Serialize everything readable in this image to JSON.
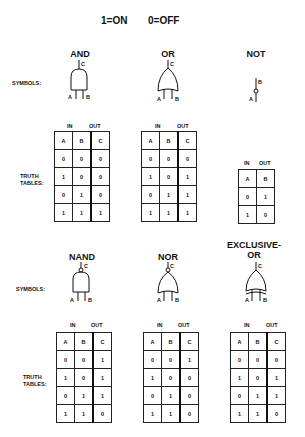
{
  "legend": {
    "on": "1=ON",
    "off": "0=OFF"
  },
  "row_labels": {
    "symbols": "SYMBOLS:",
    "truth_tables_1": "TRUTH",
    "truth_tables_2": "TABLES:"
  },
  "headers": {
    "in": "IN",
    "out": "OUT"
  },
  "gates": [
    {
      "name": "AND",
      "inputs": [
        "A",
        "B"
      ],
      "output": "C",
      "table": {
        "cols": [
          "A",
          "B",
          "C"
        ],
        "rows": [
          [
            "0",
            "0",
            "0"
          ],
          [
            "1",
            "0",
            "0"
          ],
          [
            "0",
            "1",
            "0"
          ],
          [
            "1",
            "1",
            "1"
          ]
        ]
      }
    },
    {
      "name": "OR",
      "inputs": [
        "A",
        "B"
      ],
      "output": "C",
      "table": {
        "cols": [
          "A",
          "B",
          "C"
        ],
        "rows": [
          [
            "0",
            "0",
            "0"
          ],
          [
            "1",
            "0",
            "1"
          ],
          [
            "0",
            "1",
            "1"
          ],
          [
            "1",
            "1",
            "1"
          ]
        ]
      }
    },
    {
      "name": "NOT",
      "inputs": [
        "A"
      ],
      "output": "B",
      "table": {
        "cols": [
          "A",
          "B"
        ],
        "rows": [
          [
            "0",
            "1"
          ],
          [
            "1",
            "0"
          ]
        ]
      }
    },
    {
      "name": "NAND",
      "inputs": [
        "A",
        "B"
      ],
      "output": "C",
      "table": {
        "cols": [
          "A",
          "B",
          "C"
        ],
        "rows": [
          [
            "0",
            "0",
            "1"
          ],
          [
            "1",
            "0",
            "1"
          ],
          [
            "0",
            "1",
            "1"
          ],
          [
            "1",
            "1",
            "0"
          ]
        ]
      }
    },
    {
      "name": "NOR",
      "inputs": [
        "A",
        "B"
      ],
      "output": "C",
      "table": {
        "cols": [
          "A",
          "B",
          "C"
        ],
        "rows": [
          [
            "0",
            "0",
            "1"
          ],
          [
            "1",
            "0",
            "0"
          ],
          [
            "0",
            "1",
            "0"
          ],
          [
            "1",
            "1",
            "0"
          ]
        ]
      }
    },
    {
      "name_line1": "EXCLUSIVE-",
      "name_line2": "OR",
      "inputs": [
        "A",
        "B"
      ],
      "output": "C",
      "table": {
        "cols": [
          "A",
          "B",
          "C"
        ],
        "rows": [
          [
            "0",
            "0",
            "0"
          ],
          [
            "1",
            "0",
            "1"
          ],
          [
            "0",
            "1",
            "1"
          ],
          [
            "1",
            "1",
            "0"
          ]
        ]
      }
    }
  ]
}
